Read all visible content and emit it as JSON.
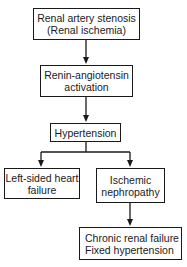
{
  "diagram": {
    "type": "flowchart",
    "nodes": [
      {
        "id": "stenosis",
        "lines": [
          "Renal artery stenosis",
          "(Renal ischemia)"
        ]
      },
      {
        "id": "renin",
        "lines": [
          "Renin-angiotensin",
          "activation"
        ]
      },
      {
        "id": "hypertension",
        "lines": [
          "Hypertension"
        ]
      },
      {
        "id": "heart_failure",
        "lines": [
          "Left-sided heart",
          "failure"
        ]
      },
      {
        "id": "nephropathy",
        "lines": [
          "Ischemic",
          "nephropathy"
        ]
      },
      {
        "id": "crf",
        "lines": [
          "Chronic renal failure",
          "Fixed hypertension"
        ]
      }
    ],
    "edges": [
      {
        "from": "stenosis",
        "to": "renin"
      },
      {
        "from": "renin",
        "to": "hypertension"
      },
      {
        "from": "hypertension",
        "to": "heart_failure"
      },
      {
        "from": "hypertension",
        "to": "nephropathy"
      },
      {
        "from": "nephropathy",
        "to": "crf"
      }
    ],
    "colors": {
      "line": "#1a1a1a",
      "background": "#ffffff"
    }
  }
}
